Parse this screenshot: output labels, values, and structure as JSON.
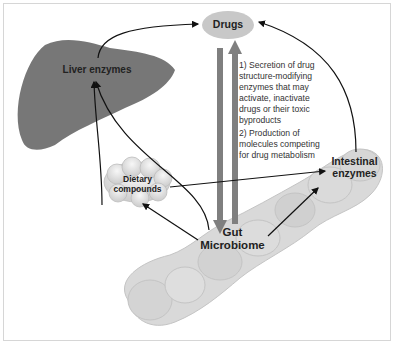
{
  "diagram": {
    "nodes": {
      "drugs": "Drugs",
      "liver": "Liver enzymes",
      "dietary_line1": "Dietary",
      "dietary_line2": "compounds",
      "gut_line1": "Gut",
      "gut_line2": "Microbiome",
      "intestinal_line1": "Intestinal",
      "intestinal_line2": "enzymes"
    },
    "annotations": {
      "point1": [
        "1) Secretion of drug",
        "structure-modifying",
        "enzymes that may",
        "activate, inactivate",
        "drugs or their toxic",
        "byproducts"
      ],
      "point2": [
        "2) Production of",
        "molecules competing",
        "for drug metabolism"
      ]
    },
    "colors": {
      "liver": "#777777",
      "intestine": "#d9d9d9",
      "drugs_ellipse": "#c8c8c8",
      "thick_arrow": "#7f7f7f"
    }
  }
}
